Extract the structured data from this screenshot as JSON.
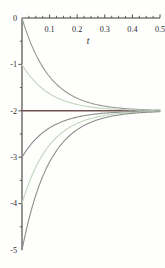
{
  "chart_data": {
    "type": "line",
    "title": "",
    "xlabel": "t",
    "ylabel": "",
    "x_range": [
      0,
      0.5
    ],
    "y_range": [
      -5,
      0
    ],
    "grid": false,
    "legend": null,
    "x_major_ticks": [
      0.1,
      0.2,
      0.3,
      0.4,
      0.5
    ],
    "x_tick_labels": [
      "0.1",
      "0.2",
      "0.3",
      "0.4",
      "0.5"
    ],
    "x_minor_step": 0.025,
    "y_major_ticks": [
      0,
      -1,
      -2,
      -3,
      -4,
      -5
    ],
    "y_tick_labels": [
      "0",
      "-1",
      "-2",
      "-3",
      "-4",
      "-5"
    ],
    "y_minor_step": 0.5,
    "model": "y(t) = -2 + (y0 + 2) * exp(-10 * t)",
    "equilibrium": {
      "value": -2,
      "color": "#6e5050",
      "stroke_width": 1.6
    },
    "x_samples": [
      0,
      0.05,
      0.1,
      0.15,
      0.2,
      0.25,
      0.3,
      0.35,
      0.4,
      0.45,
      0.5
    ],
    "series": [
      {
        "name": "y0 = 0",
        "y0": 0,
        "asymptote": -2,
        "rate": 10,
        "color": "#989898",
        "values": [
          0,
          -0.787,
          -1.264,
          -1.554,
          -1.729,
          -1.836,
          -1.9,
          -1.94,
          -1.963,
          -1.978,
          -1.987
        ]
      },
      {
        "name": "y0 = -1",
        "y0": -1,
        "asymptote": -2,
        "rate": 10,
        "color": "#c3d5bd",
        "values": [
          -1,
          -1.394,
          -1.632,
          -1.777,
          -1.865,
          -1.918,
          -1.95,
          -1.97,
          -1.982,
          -1.989,
          -1.993
        ]
      },
      {
        "name": "y0 = -3",
        "y0": -3,
        "asymptote": -2,
        "rate": 10,
        "color": "#8e8e8e",
        "values": [
          -3,
          -2.607,
          -2.368,
          -2.223,
          -2.135,
          -2.082,
          -2.05,
          -2.03,
          -2.018,
          -2.011,
          -2.007
        ]
      },
      {
        "name": "y0 = -4",
        "y0": -4,
        "asymptote": -2,
        "rate": 10,
        "color": "#c3d5bd",
        "values": [
          -4,
          -3.213,
          -2.736,
          -2.446,
          -2.271,
          -2.164,
          -2.1,
          -2.06,
          -2.037,
          -2.022,
          -2.013
        ]
      },
      {
        "name": "y0 = -5",
        "y0": -5,
        "asymptote": -2,
        "rate": 10,
        "color": "#8e8e8e",
        "values": [
          -5,
          -3.82,
          -3.104,
          -2.669,
          -2.406,
          -2.246,
          -2.149,
          -2.091,
          -2.055,
          -2.033,
          -2.02
        ]
      }
    ],
    "colors": {
      "axis": "#3b3b3b",
      "text": "#2f2f2f",
      "background": "#fefefd"
    }
  }
}
